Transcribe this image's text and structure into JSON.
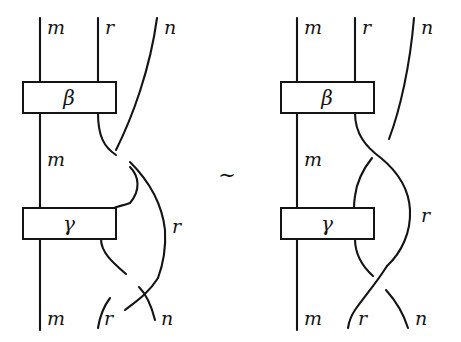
{
  "figure": {
    "kind": "braid-diagram-equivalence",
    "relation_symbol": "∼",
    "background_color": "#ffffff",
    "ink_color": "#141414",
    "diagrams": [
      {
        "id": "left",
        "name": "left-braid-diagram",
        "boxes": [
          {
            "id": "beta",
            "label": "β",
            "x": 23,
            "y": 82,
            "width": 93,
            "height": 31
          },
          {
            "id": "gamma",
            "label": "γ",
            "x": 23,
            "y": 208,
            "width": 93,
            "height": 31
          }
        ],
        "labels": {
          "top_m": "m",
          "top_r": "r",
          "top_n": "n",
          "mid_m": "m",
          "mid_r": "r",
          "bottom_m": "m",
          "bottom_r": "r",
          "bottom_n": "n"
        }
      },
      {
        "id": "right",
        "name": "right-braid-diagram",
        "boxes": [
          {
            "id": "beta",
            "label": "β",
            "x": 281,
            "y": 82,
            "width": 93,
            "height": 31
          },
          {
            "id": "gamma",
            "label": "γ",
            "x": 281,
            "y": 208,
            "width": 93,
            "height": 31
          }
        ],
        "labels": {
          "top_m": "m",
          "top_r": "r",
          "top_n": "n",
          "mid_m": "m",
          "mid_r": "r",
          "bottom_m": "m",
          "bottom_r": "r",
          "bottom_n": "n"
        }
      }
    ]
  }
}
